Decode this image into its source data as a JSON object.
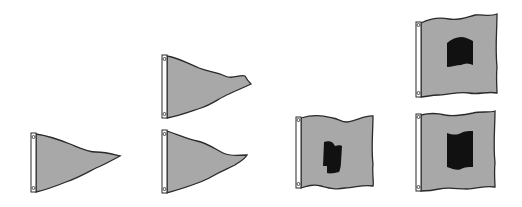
{
  "illustration": {
    "description": "Signal flags: pennants and square flags",
    "colors": {
      "fill": "#a8a8a8",
      "outline": "#2a2a2a",
      "hoist": "#ffffff",
      "center": "#111111"
    },
    "groups": [
      {
        "name": "group-1",
        "flags": [
          {
            "type": "pennant"
          }
        ]
      },
      {
        "name": "group-2",
        "flags": [
          {
            "type": "pennant"
          },
          {
            "type": "pennant"
          }
        ]
      },
      {
        "name": "group-3",
        "flags": [
          {
            "type": "square-with-center"
          }
        ]
      },
      {
        "name": "group-4",
        "flags": [
          {
            "type": "square-with-center"
          },
          {
            "type": "square-with-center"
          }
        ]
      }
    ]
  }
}
